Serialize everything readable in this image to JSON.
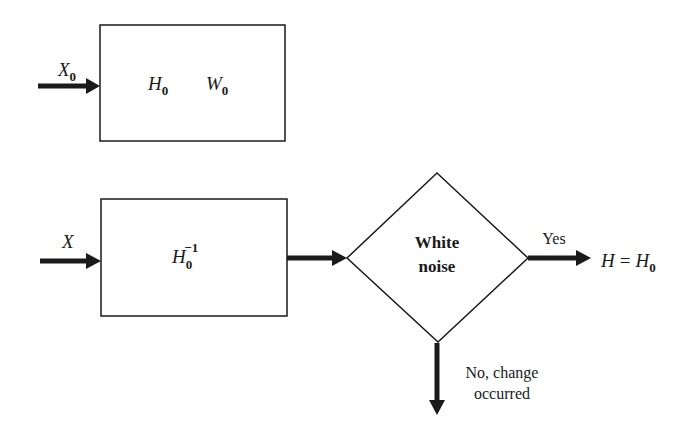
{
  "diagram": {
    "colors": {
      "stroke": "#1a1a1a",
      "background": "#ffffff"
    },
    "model_block": {
      "input_label": {
        "base": "X",
        "sub": "0"
      },
      "contents": [
        {
          "base": "H",
          "sub": "0"
        },
        {
          "base": "W",
          "sub": "0"
        }
      ]
    },
    "filter_block": {
      "input_label": {
        "base": "X"
      },
      "contents": {
        "base": "H",
        "sub": "0",
        "sup": "−1"
      }
    },
    "decision": {
      "label_line1": "White",
      "label_line2": "noise",
      "yes_label": "Yes",
      "yes_result": {
        "lhs": "H",
        "op": "=",
        "rhs_base": "H",
        "rhs_sub": "0"
      },
      "no_label_line1": "No, change",
      "no_label_line2": "occurred"
    }
  }
}
